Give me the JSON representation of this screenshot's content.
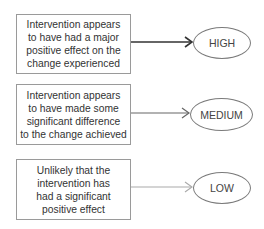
{
  "diagram": {
    "rows": [
      {
        "description": "Intervention appears\nto have had a major\npositive effect on the\nchange experienced",
        "level": "HIGH",
        "arrow_color": "#333333",
        "arrow_width": 1.6
      },
      {
        "description": "Intervention appears\nto have made some\nsignificant difference\nto the change achieved",
        "level": "MEDIUM",
        "arrow_color": "#666666",
        "arrow_width": 1.2
      },
      {
        "description": "Unlikely that the\nintervention has\nhad a significant\npositive effect",
        "level": "LOW",
        "arrow_color": "#aaaaaa",
        "arrow_width": 1.1
      }
    ]
  }
}
